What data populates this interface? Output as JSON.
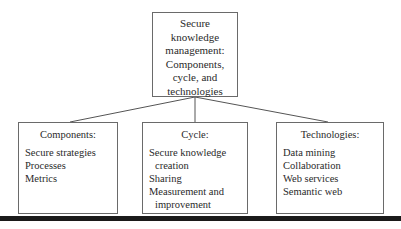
{
  "root": {
    "lines": [
      "Secure",
      "knowledge",
      "management:",
      "Components,",
      "cycle, and",
      "technologies"
    ]
  },
  "children": [
    {
      "heading": "Components:",
      "items": [
        "Secure strategies",
        "Processes",
        "Metrics"
      ]
    },
    {
      "heading": "Cycle:",
      "items": [
        "Secure knowledge",
        "creation",
        "Sharing",
        "Measurement and",
        "improvement"
      ]
    },
    {
      "heading": "Technologies:",
      "items": [
        "Data mining",
        "Collaboration",
        "Web services",
        "Semantic web"
      ]
    }
  ],
  "colors": {
    "border": "#6a6a6a",
    "text": "#2a2a2a",
    "bar": "#1a1a1a"
  }
}
